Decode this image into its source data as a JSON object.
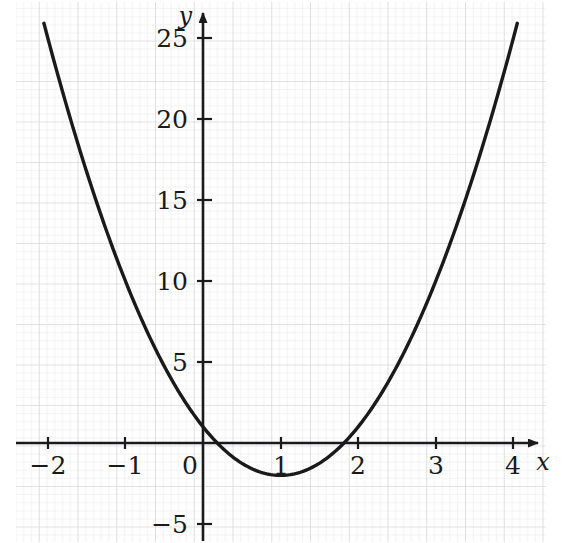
{
  "figure": {
    "kind": "cartesian-graph",
    "background_color": "#ffffff",
    "ink_color": "#1a1a1a",
    "grid_minor_color": "#e2e2e6",
    "grid_major_color": "#cfcfd6"
  },
  "axes": {
    "x_axis_label": "x",
    "y_axis_label": "y",
    "x_tick_labels": [
      "−2",
      "−1",
      "0",
      "1",
      "2",
      "3",
      "4"
    ],
    "x_tick_values": [
      -2,
      -1,
      0,
      1,
      2,
      3,
      4
    ],
    "y_tick_labels": [
      "−5",
      "5",
      "10",
      "15",
      "20",
      "25"
    ],
    "y_tick_values": [
      -5,
      5,
      10,
      15,
      20,
      25
    ],
    "origin_label": "0",
    "x_arrow": "right-arrow-head",
    "y_arrow": "up-arrow-head"
  },
  "chart_data": {
    "type": "line",
    "title": "",
    "subtitle": "",
    "xlabel": "x",
    "ylabel": "y",
    "xlim": [
      -2.4,
      4.5
    ],
    "ylim": [
      -7.5,
      27.5
    ],
    "xticks": [
      -2,
      -1,
      0,
      1,
      2,
      3,
      4
    ],
    "yticks": [
      -5,
      5,
      10,
      15,
      20,
      25
    ],
    "grid": true,
    "grid_minor_step": 0.2,
    "grid_major_step": 1,
    "legend": null,
    "annotations": [],
    "series": [
      {
        "name": "y = 3x² − 6x + 1",
        "equation": "y = 3x^2 - 6x + 1",
        "color": "#1a1a1a",
        "line_width": 3,
        "vertex": [
          1,
          -2
        ],
        "y_intercept": 1,
        "roots": [
          0.18,
          1.82
        ],
        "x_domain": [
          -2.05,
          4.05
        ],
        "x": [
          -2.05,
          -1.9,
          -1.75,
          -1.6,
          -1.45,
          -1.3,
          -1.15,
          -1.0,
          -0.85,
          -0.7,
          -0.55,
          -0.4,
          -0.25,
          -0.1,
          0.05,
          0.2,
          0.35,
          0.5,
          0.65,
          0.8,
          0.95,
          1.1,
          1.25,
          1.4,
          1.55,
          1.7,
          1.85,
          2.0,
          2.15,
          2.3,
          2.45,
          2.6,
          2.75,
          2.9,
          3.05,
          3.2,
          3.35,
          3.5,
          3.65,
          3.8,
          3.95,
          4.05
        ],
        "y": [
          25.9,
          23.2,
          20.7,
          18.3,
          16.0,
          13.9,
          11.9,
          10.0,
          8.3,
          6.7,
          5.2,
          3.9,
          2.7,
          1.6,
          0.71,
          0.12,
          -0.29,
          -0.5,
          -0.58,
          -0.88,
          -1.99,
          -1.97,
          -1.81,
          -1.52,
          -1.09,
          -0.53,
          0.17,
          1.0,
          1.97,
          3.07,
          4.32,
          5.68,
          7.19,
          8.83,
          10.6,
          12.5,
          14.6,
          16.8,
          19.1,
          21.5,
          24.1,
          25.8
        ]
      }
    ]
  }
}
